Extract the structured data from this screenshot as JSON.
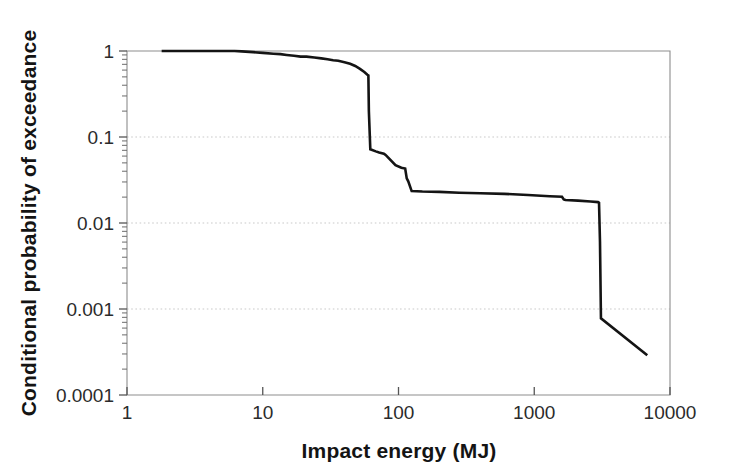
{
  "chart_data": {
    "type": "line",
    "title": "",
    "xlabel": "Impact energy (MJ)",
    "ylabel": "Conditional probability of exceedance",
    "xscale": "log",
    "yscale": "log",
    "xlim": [
      1,
      10000
    ],
    "ylim": [
      0.0001,
      1
    ],
    "xticks": [
      "1",
      "10",
      "100",
      "1000",
      "10000"
    ],
    "xtick_values": [
      1,
      10,
      100,
      1000,
      10000
    ],
    "yticks": [
      "1",
      "0.1",
      "0.01",
      "0.001",
      "0.0001"
    ],
    "ytick_values": [
      1,
      0.1,
      0.01,
      0.001,
      0.0001
    ],
    "grid": "horizontal-dotted-at-major-y",
    "legend": "none",
    "series": [
      {
        "name": "Conditional exceedance curve",
        "color": "#141414",
        "x": [
          1.8,
          3.0,
          4.5,
          6.2,
          7.0,
          8.5,
          10.0,
          12.0,
          13.5,
          15.0,
          17.0,
          19.0,
          21.0,
          24.0,
          27.0,
          30.0,
          33.0,
          36.0,
          40.0,
          44.0,
          48.0,
          52.0,
          56.0,
          59.0,
          60.0,
          60.5,
          62.0,
          68.0,
          72.0,
          78.0,
          80.0,
          82.0,
          95.0,
          105.0,
          112.0,
          115.0,
          118.0,
          125.0,
          150.0,
          200.0,
          280.0,
          400.0,
          600.0,
          900.0,
          1300.0,
          1600.0,
          1650.0,
          1700.0,
          2100.0,
          2600.0,
          2950.0,
          3000.0,
          3050.0,
          3100.0,
          6800.0
        ],
        "y": [
          1.0,
          1.0,
          1.0,
          1.0,
          0.99,
          0.97,
          0.95,
          0.93,
          0.92,
          0.9,
          0.88,
          0.86,
          0.86,
          0.84,
          0.82,
          0.8,
          0.78,
          0.77,
          0.74,
          0.71,
          0.67,
          0.62,
          0.57,
          0.53,
          0.52,
          0.2,
          0.072,
          0.068,
          0.066,
          0.064,
          0.062,
          0.06,
          0.047,
          0.044,
          0.043,
          0.033,
          0.0305,
          0.0235,
          0.0232,
          0.023,
          0.0225,
          0.0222,
          0.0218,
          0.0212,
          0.0205,
          0.0202,
          0.0188,
          0.0185,
          0.0182,
          0.0178,
          0.0175,
          0.0172,
          0.006,
          0.00078,
          0.00029
        ]
      }
    ],
    "annotations": [
      "Curve begins at probability 1 near 1.8 MJ",
      "Sharp cliff near 60 MJ from about 0.52 down to about 0.07",
      "Stepped plateau near 0.02 between roughly 125 MJ and 3000 MJ",
      "Second sharp cliff near 3000 MJ from about 0.017 down to about 0.0008",
      "Curve ends near 6800 MJ at about 0.0003"
    ]
  },
  "axes": {
    "x_title": "Impact energy (MJ)",
    "y_title": "Conditional probability of exceedance",
    "x_tick_labels": [
      "1",
      "10",
      "100",
      "1000",
      "10000"
    ],
    "y_tick_labels": [
      "1",
      "0.1",
      "0.01",
      "0.001",
      "0.0001"
    ]
  },
  "colors": {
    "curve": "#141414",
    "frame": "#8d8d8d",
    "grid": "#c9c9c9",
    "background": "#ffffff",
    "text": "#141414"
  }
}
